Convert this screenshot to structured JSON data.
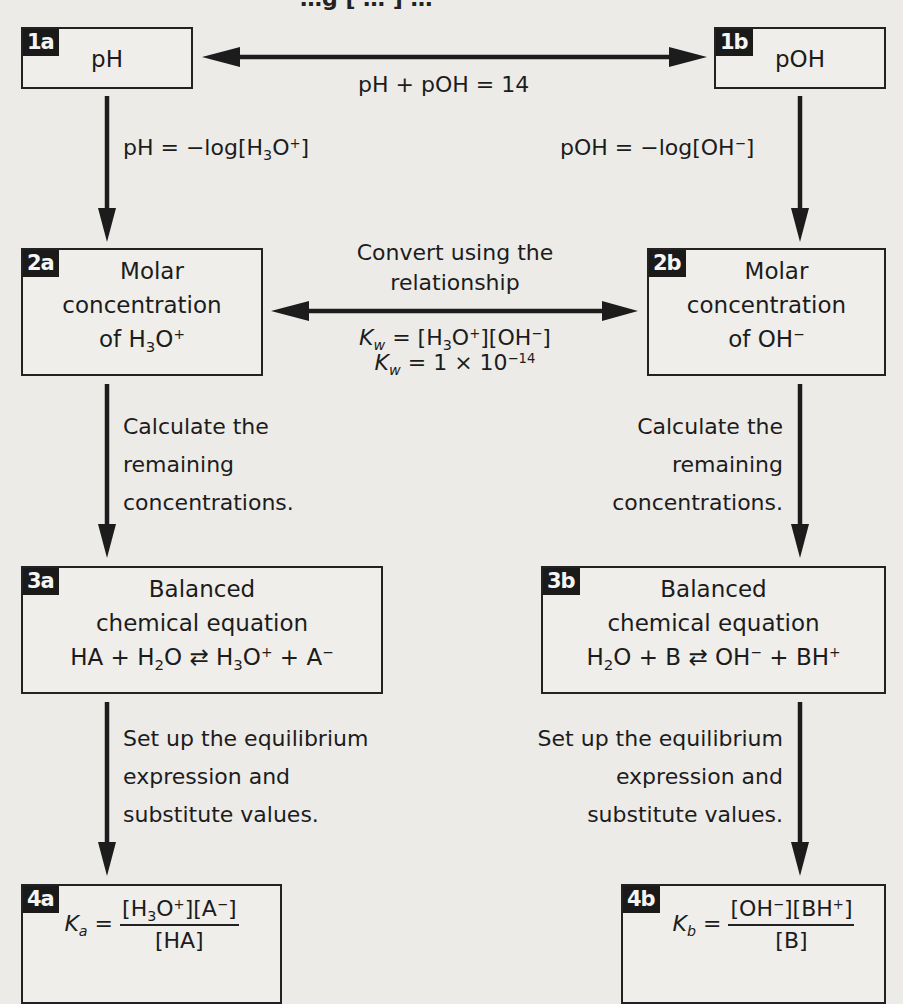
{
  "diagram": {
    "title_partial": "…g [ … ] …",
    "colors": {
      "background": "#ecebe8",
      "ink": "#1c1c1c",
      "badge_bg": "#1a1a1a",
      "badge_text": "#f4f4f4"
    },
    "nodes": {
      "n1a": {
        "badge": "1a",
        "label": "pH"
      },
      "n1b": {
        "badge": "1b",
        "label": "pOH"
      },
      "n2a": {
        "badge": "2a",
        "line1": "Molar",
        "line2": "concentration",
        "line3_prefix": "of H",
        "line3_sub": "3",
        "line3_mid": "O",
        "line3_sup": "+"
      },
      "n2b": {
        "badge": "2b",
        "line1": "Molar",
        "line2": "concentration",
        "line3_prefix": "of OH",
        "line3_sup": "−"
      },
      "n3a": {
        "badge": "3a",
        "line1": "Balanced",
        "line2": "chemical equation",
        "equation": "HA + H2O ⇄ H3O+ + A−"
      },
      "n3b": {
        "badge": "3b",
        "line1": "Balanced",
        "line2": "chemical equation",
        "equation": "H2O + B ⇄ OH− + BH+"
      },
      "n4a": {
        "badge": "4a",
        "lhs": "K",
        "lhs_sub": "a",
        "numerator": "[H3O+][A−]",
        "denominator": "[HA]"
      },
      "n4b": {
        "badge": "4b",
        "lhs": "K",
        "lhs_sub": "b",
        "numerator": "[OH−][BH+]",
        "denominator": "[B]"
      }
    },
    "edges": {
      "e1a_1b": {
        "label": "pH + pOH = 14",
        "direction": "bidirectional"
      },
      "e1a_2a": {
        "label": "pH = −log[H3O+]",
        "direction": "down"
      },
      "e1b_2b": {
        "label": "pOH = −log[OH−]",
        "direction": "down"
      },
      "e2a_2b": {
        "label_line1": "Convert using the",
        "label_line2": "relationship",
        "formula1": "Kw = [H3O+][OH−]",
        "formula2": "Kw = 1 × 10−14",
        "direction": "bidirectional"
      },
      "e2a_3a": {
        "line1": "Calculate the",
        "line2": "remaining",
        "line3": "concentrations.",
        "direction": "down"
      },
      "e2b_3b": {
        "line1": "Calculate the",
        "line2": "remaining",
        "line3": "concentrations.",
        "direction": "down"
      },
      "e3a_4a": {
        "line1": "Set up the equilibrium",
        "line2": "expression and",
        "line3": "substitute values.",
        "direction": "down"
      },
      "e3b_4b": {
        "line1": "Set up the equilibrium",
        "line2": "expression and",
        "line3": "substitute values.",
        "direction": "down"
      }
    },
    "text_bits": {
      "op_plus": " + ",
      "op_eq": " = ",
      "eq_arrow": " ⇄ ",
      "times": " × ",
      "ten": "10",
      "exp": "−14",
      "one": "1",
      "K": "K",
      "w": "w",
      "H": "H",
      "O": "O",
      "OH": "OH",
      "A": "A",
      "B": "B",
      "BH": "BH",
      "HA": "HA",
      "sub2": "2",
      "sub3": "3",
      "plus": "+",
      "minus": "−",
      "lb": "[",
      "rb": "]",
      "ph_eq": "pH = −log[H",
      "poh_eq": "pOH = −log[OH"
    }
  }
}
